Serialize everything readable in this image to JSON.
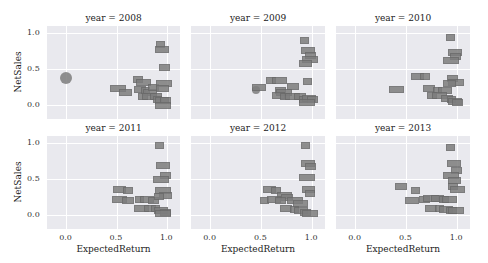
{
  "chart_data": {
    "type": "scatter",
    "facet_by": "year",
    "facet_title_prefix": "year = ",
    "xlabel": "ExpectedReturn",
    "ylabel": "NetSales",
    "xticks": [
      "0.0",
      "0.5",
      "1.0"
    ],
    "yticks": [
      "0.0",
      "0.5",
      "1.0"
    ],
    "xlim": [
      -0.19,
      1.13
    ],
    "ylim": [
      -0.2,
      1.1
    ],
    "grid": true,
    "panel_background": "#e9e9ee",
    "marker_color": "#7d7d7d",
    "note": "Points rendered as small text-label boxes (labels illegible at source resolution)",
    "panels": [
      {
        "year": "2008",
        "title": "year = 2008",
        "bubble": {
          "x": 0.0,
          "y": 0.38,
          "r": 6
        },
        "points": [
          [
            0.93,
            0.85
          ],
          [
            0.94,
            0.78
          ],
          [
            0.97,
            0.52
          ],
          [
            0.5,
            0.24
          ],
          [
            0.58,
            0.18
          ],
          [
            0.7,
            0.36
          ],
          [
            0.76,
            0.32
          ],
          [
            0.72,
            0.22
          ],
          [
            0.78,
            0.2
          ],
          [
            0.82,
            0.18
          ],
          [
            0.86,
            0.25
          ],
          [
            0.96,
            0.3
          ],
          [
            0.95,
            0.24
          ],
          [
            0.75,
            0.12
          ],
          [
            0.82,
            0.12
          ],
          [
            0.88,
            0.12
          ],
          [
            0.9,
            0.08
          ],
          [
            0.94,
            0.06
          ],
          [
            0.98,
            0.07
          ],
          [
            0.95,
            0.0
          ]
        ]
      },
      {
        "year": "2009",
        "title": "year = 2009",
        "bubble": {
          "x": 0.45,
          "y": 0.2,
          "r": 4
        },
        "points": [
          [
            0.92,
            0.91
          ],
          [
            0.95,
            0.76
          ],
          [
            0.98,
            0.7
          ],
          [
            0.97,
            0.64
          ],
          [
            0.93,
            0.58
          ],
          [
            0.59,
            0.34
          ],
          [
            0.67,
            0.34
          ],
          [
            0.8,
            0.26
          ],
          [
            0.95,
            0.33
          ],
          [
            0.47,
            0.25
          ],
          [
            0.68,
            0.2
          ],
          [
            0.72,
            0.18
          ],
          [
            0.66,
            0.13
          ],
          [
            0.73,
            0.12
          ],
          [
            0.8,
            0.12
          ],
          [
            0.87,
            0.12
          ],
          [
            0.91,
            0.08
          ],
          [
            0.96,
            0.1
          ],
          [
            1.0,
            0.08
          ],
          [
            0.94,
            0.04
          ]
        ]
      },
      {
        "year": "2010",
        "title": "year = 2010",
        "bubble": null,
        "points": [
          [
            0.93,
            0.94
          ],
          [
            0.97,
            0.74
          ],
          [
            0.98,
            0.68
          ],
          [
            0.93,
            0.62
          ],
          [
            0.6,
            0.4
          ],
          [
            0.68,
            0.4
          ],
          [
            0.4,
            0.22
          ],
          [
            0.72,
            0.24
          ],
          [
            0.8,
            0.2
          ],
          [
            0.87,
            0.2
          ],
          [
            0.95,
            0.38
          ],
          [
            0.98,
            0.32
          ],
          [
            0.92,
            0.3
          ],
          [
            0.75,
            0.13
          ],
          [
            0.82,
            0.13
          ],
          [
            0.89,
            0.1
          ],
          [
            0.94,
            0.08
          ],
          [
            0.97,
            0.05
          ],
          [
            1.0,
            0.04
          ]
        ]
      },
      {
        "year": "2011",
        "title": "year = 2011",
        "bubble": null,
        "points": [
          [
            0.92,
            0.97
          ],
          [
            0.95,
            0.7
          ],
          [
            0.98,
            0.56
          ],
          [
            0.93,
            0.5
          ],
          [
            0.52,
            0.36
          ],
          [
            0.6,
            0.34
          ],
          [
            0.52,
            0.22
          ],
          [
            0.6,
            0.2
          ],
          [
            0.72,
            0.22
          ],
          [
            0.79,
            0.22
          ],
          [
            0.86,
            0.2
          ],
          [
            0.95,
            0.34
          ],
          [
            0.98,
            0.28
          ],
          [
            0.91,
            0.26
          ],
          [
            0.74,
            0.1
          ],
          [
            0.82,
            0.1
          ],
          [
            0.88,
            0.1
          ],
          [
            0.93,
            0.07
          ],
          [
            0.98,
            0.04
          ],
          [
            0.95,
            0.02
          ]
        ]
      },
      {
        "year": "2012",
        "title": "year = 2012",
        "bubble": null,
        "points": [
          [
            0.93,
            0.98
          ],
          [
            0.95,
            0.72
          ],
          [
            0.98,
            0.68
          ],
          [
            0.94,
            0.52
          ],
          [
            0.57,
            0.36
          ],
          [
            0.64,
            0.34
          ],
          [
            0.72,
            0.28
          ],
          [
            0.75,
            0.25
          ],
          [
            0.52,
            0.2
          ],
          [
            0.62,
            0.22
          ],
          [
            0.68,
            0.2
          ],
          [
            0.82,
            0.2
          ],
          [
            0.96,
            0.36
          ],
          [
            0.97,
            0.3
          ],
          [
            0.88,
            0.16
          ],
          [
            0.74,
            0.1
          ],
          [
            0.82,
            0.08
          ],
          [
            0.88,
            0.06
          ],
          [
            0.93,
            0.04
          ],
          [
            0.97,
            0.02
          ]
        ]
      },
      {
        "year": "2013",
        "title": "year = 2013",
        "bubble": null,
        "points": [
          [
            0.93,
            0.95
          ],
          [
            0.96,
            0.72
          ],
          [
            0.99,
            0.62
          ],
          [
            0.93,
            0.56
          ],
          [
            0.97,
            0.48
          ],
          [
            0.95,
            0.4
          ],
          [
            1.0,
            0.36
          ],
          [
            0.44,
            0.4
          ],
          [
            0.58,
            0.34
          ],
          [
            0.55,
            0.2
          ],
          [
            0.67,
            0.22
          ],
          [
            0.74,
            0.24
          ],
          [
            0.8,
            0.24
          ],
          [
            0.86,
            0.22
          ],
          [
            0.92,
            0.22
          ],
          [
            0.74,
            0.1
          ],
          [
            0.82,
            0.1
          ],
          [
            0.88,
            0.08
          ],
          [
            0.94,
            0.06
          ],
          [
            0.98,
            0.06
          ]
        ]
      }
    ]
  },
  "axes": {
    "xlabel": "ExpectedReturn",
    "ylabel": "NetSales",
    "xticks": [
      "0.0",
      "0.5",
      "1.0"
    ],
    "yticks": [
      "1.0",
      "0.5",
      "0.0"
    ]
  },
  "panels": [
    {
      "title": "year = 2008"
    },
    {
      "title": "year = 2009"
    },
    {
      "title": "year = 2010"
    },
    {
      "title": "year = 2011"
    },
    {
      "title": "year = 2012"
    },
    {
      "title": "year = 2013"
    }
  ]
}
